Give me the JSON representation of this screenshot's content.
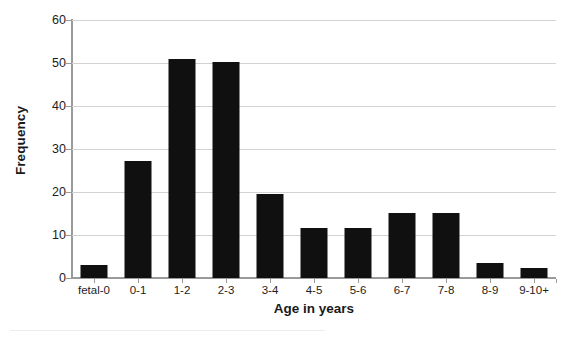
{
  "chart_data": {
    "type": "bar",
    "title": "",
    "xlabel": "Age in years",
    "ylabel": "Frequency",
    "categories": [
      "fetal-0",
      "0-1",
      "1-2",
      "2-3",
      "3-4",
      "4-5",
      "5-6",
      "6-7",
      "7-8",
      "8-9",
      "9-10+"
    ],
    "values": [
      3.0,
      27.3,
      51.0,
      50.3,
      19.6,
      11.6,
      11.6,
      15.2,
      15.2,
      3.4,
      2.3
    ],
    "ylim": [
      0,
      60
    ],
    "yticks": [
      0,
      10,
      20,
      30,
      40,
      50,
      60
    ],
    "ytick_labels": [
      "0",
      "10",
      "20",
      "30",
      "40",
      "50",
      "60"
    ],
    "grid": true,
    "grid_axis": "y",
    "legend": false,
    "bar_color": "#101010",
    "gridline_color": "#d2d2d2",
    "axis_color": "#9a9a9a",
    "background": "#ffffff"
  }
}
